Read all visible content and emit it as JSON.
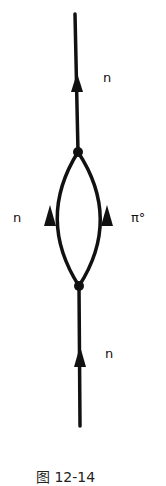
{
  "diagram": {
    "type": "feynman-diagram",
    "labels": {
      "outgoing": "n",
      "loop_left": "n",
      "loop_right": "π°",
      "incoming": "n"
    },
    "caption": "图 12-14",
    "colors": {
      "line": "#111111",
      "background": "#ffffff"
    }
  }
}
